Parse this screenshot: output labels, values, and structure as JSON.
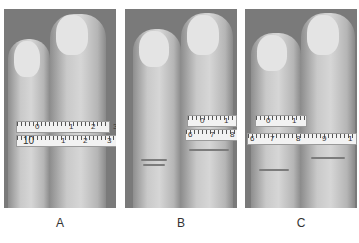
{
  "figure": {
    "panels": [
      {
        "label": "A",
        "description": "Two fingers with measuring tape around both at proximal phalanx",
        "tape_upper_numbers": [
          "0",
          "1",
          "2",
          "3"
        ],
        "tape_lower_numbers": [
          "10",
          "1",
          "2",
          "3"
        ]
      },
      {
        "label": "B",
        "description": "Measuring tape around single finger, adjacent finger with swollen knuckle",
        "tape_upper_numbers": [
          "0",
          "1"
        ],
        "tape_lower_numbers": [
          "6",
          "7",
          "8"
        ]
      },
      {
        "label": "C",
        "description": "Measuring tape around two fingers at different levels",
        "tape_upper_numbers": [
          "0",
          "1"
        ],
        "tape_lower_numbers": [
          "6",
          "7",
          "8",
          "9",
          "1"
        ]
      }
    ]
  }
}
